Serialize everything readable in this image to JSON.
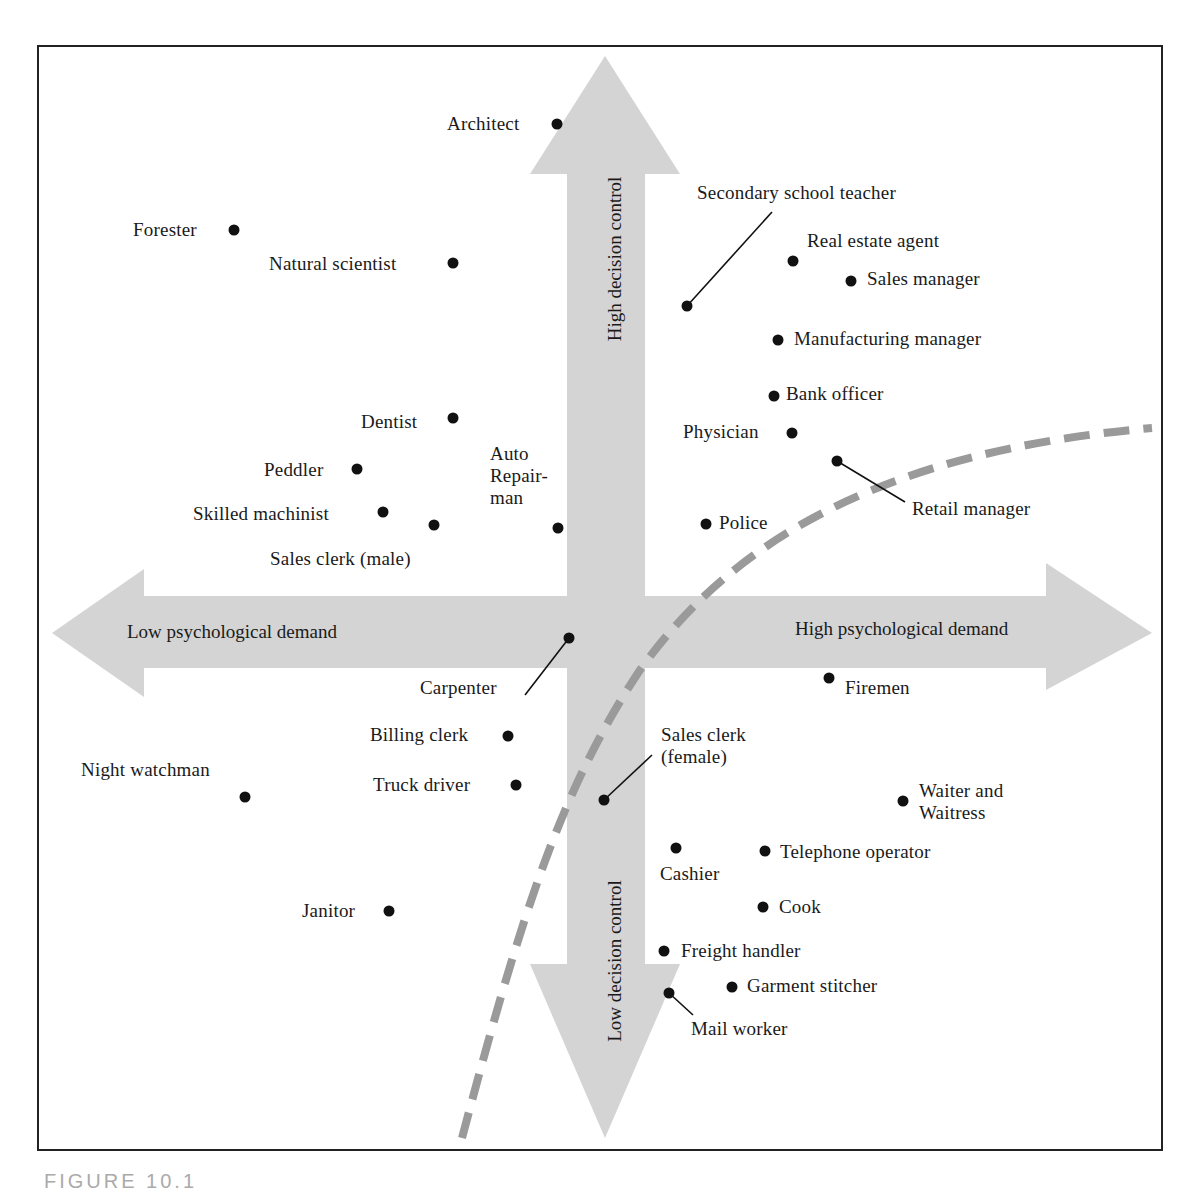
{
  "figure": {
    "caption": "FIGURE 10.1"
  },
  "axes": {
    "top": "High decision control",
    "bottom": "Low decision control",
    "left": "Low psychological demand",
    "right": "High psychological demand"
  },
  "colors": {
    "arrow_fill": "#d4d4d4",
    "dashed_curve": "#9a9a9a",
    "dot": "#111111",
    "frame": "#222222"
  },
  "points": [
    {
      "label": "Architect",
      "dot": [
        557,
        124
      ],
      "text": [
        447,
        113
      ],
      "side": "left"
    },
    {
      "label": "Forester",
      "dot": [
        234,
        230
      ],
      "text": [
        133,
        219
      ],
      "side": "left"
    },
    {
      "label": "Natural scientist",
      "dot": [
        453,
        263
      ],
      "text": [
        269,
        253
      ],
      "side": "left"
    },
    {
      "label": "Secondary school teacher",
      "dot": [
        687,
        306
      ],
      "text": [
        697,
        182
      ],
      "side": "right",
      "leader": [
        772,
        212
      ]
    },
    {
      "label": "Real estate agent",
      "dot": [
        793,
        261
      ],
      "text": [
        807,
        230
      ],
      "side": "right"
    },
    {
      "label": "Sales manager",
      "dot": [
        851,
        281
      ],
      "text": [
        867,
        268
      ],
      "side": "right"
    },
    {
      "label": "Manufacturing manager",
      "dot": [
        778,
        340
      ],
      "text": [
        794,
        328
      ],
      "side": "right"
    },
    {
      "label": "Bank officer",
      "dot": [
        774,
        396
      ],
      "text": [
        786,
        383
      ],
      "side": "right"
    },
    {
      "label": "Physician",
      "dot": [
        792,
        433
      ],
      "text": [
        683,
        421
      ],
      "side": "left"
    },
    {
      "label": "Retail manager",
      "dot": [
        837,
        461
      ],
      "text": [
        912,
        498
      ],
      "side": "right",
      "leader": [
        905,
        502
      ]
    },
    {
      "label": "Dentist",
      "dot": [
        453,
        418
      ],
      "text": [
        361,
        411
      ],
      "side": "left"
    },
    {
      "label": "Peddler",
      "dot": [
        357,
        469
      ],
      "text": [
        264,
        459
      ],
      "side": "left"
    },
    {
      "label": "Skilled machinist",
      "dot": [
        383,
        512
      ],
      "text": [
        193,
        503
      ],
      "side": "left"
    },
    {
      "label": "Sales clerk (male)",
      "dot": [
        434,
        525
      ],
      "text": [
        270,
        548
      ],
      "side": "below"
    },
    {
      "label": "Auto\nRepair-\nman",
      "dot": [
        558,
        528
      ],
      "text": [
        490,
        443
      ],
      "side": "above"
    },
    {
      "label": "Police",
      "dot": [
        706,
        524
      ],
      "text": [
        719,
        512
      ],
      "side": "right"
    },
    {
      "label": "Carpenter",
      "dot": [
        569,
        638
      ],
      "text": [
        420,
        677
      ],
      "side": "left",
      "leader": [
        525,
        695
      ]
    },
    {
      "label": "Firemen",
      "dot": [
        829,
        678
      ],
      "text": [
        845,
        677
      ],
      "side": "right"
    },
    {
      "label": "Billing clerk",
      "dot": [
        508,
        736
      ],
      "text": [
        370,
        724
      ],
      "side": "left"
    },
    {
      "label": "Night watchman",
      "dot": [
        245,
        797
      ],
      "text": [
        81,
        759
      ],
      "side": "above"
    },
    {
      "label": "Truck driver",
      "dot": [
        516,
        785
      ],
      "text": [
        373,
        774
      ],
      "side": "left"
    },
    {
      "label": "Sales clerk\n(female)",
      "dot": [
        604,
        800
      ],
      "text": [
        661,
        724
      ],
      "side": "right",
      "leader": [
        652,
        755
      ]
    },
    {
      "label": "Waiter and\nWaitress",
      "dot": [
        903,
        801
      ],
      "text": [
        919,
        780
      ],
      "side": "right"
    },
    {
      "label": "Cashier",
      "dot": [
        676,
        848
      ],
      "text": [
        660,
        863
      ],
      "side": "below"
    },
    {
      "label": "Telephone operator",
      "dot": [
        765,
        851
      ],
      "text": [
        780,
        841
      ],
      "side": "right"
    },
    {
      "label": "Janitor",
      "dot": [
        389,
        911
      ],
      "text": [
        302,
        900
      ],
      "side": "left"
    },
    {
      "label": "Cook",
      "dot": [
        763,
        907
      ],
      "text": [
        779,
        896
      ],
      "side": "right"
    },
    {
      "label": "Freight handler",
      "dot": [
        664,
        951
      ],
      "text": [
        681,
        940
      ],
      "side": "right"
    },
    {
      "label": "Garment stitcher",
      "dot": [
        732,
        987
      ],
      "text": [
        747,
        975
      ],
      "side": "right"
    },
    {
      "label": "Mail worker",
      "dot": [
        669,
        993
      ],
      "text": [
        691,
        1018
      ],
      "side": "below",
      "leader": [
        693,
        1015
      ]
    }
  ]
}
